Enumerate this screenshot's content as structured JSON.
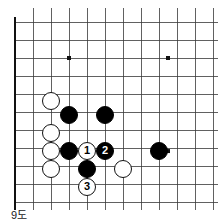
{
  "caption": "9도",
  "board": {
    "type": "go-board-diagram",
    "origin_x": 15,
    "origin_y": 22,
    "cell": 18,
    "cols": 12,
    "rows": 11,
    "line_color": "#3a3a3a",
    "edge_color": "#111111",
    "line_width": 0.8,
    "edge_width": 2.6,
    "background": "#ffffff",
    "thick_edges": [
      "left",
      "bottom"
    ],
    "star_points": [
      {
        "col": 3,
        "row": 2
      },
      {
        "col": 8.5,
        "row": 2
      },
      {
        "col": 8.5,
        "row": 7.17
      }
    ],
    "stone_radius": 9,
    "stones": [
      {
        "color": "white",
        "col": 2,
        "row": 4.39,
        "label": ""
      },
      {
        "color": "black",
        "col": 3,
        "row": 5.17,
        "label": ""
      },
      {
        "color": "black",
        "col": 5,
        "row": 5.17,
        "label": ""
      },
      {
        "color": "white",
        "col": 2,
        "row": 6.17,
        "label": ""
      },
      {
        "color": "white",
        "col": 2,
        "row": 7.17,
        "label": ""
      },
      {
        "color": "black",
        "col": 3,
        "row": 7.17,
        "label": ""
      },
      {
        "color": "white",
        "col": 4,
        "row": 7.17,
        "label": "1"
      },
      {
        "color": "black",
        "col": 5,
        "row": 7.17,
        "label": "2"
      },
      {
        "color": "black",
        "col": 8,
        "row": 7.17,
        "label": ""
      },
      {
        "color": "white",
        "col": 2,
        "row": 8.17,
        "label": ""
      },
      {
        "color": "black",
        "col": 4,
        "row": 8.17,
        "label": ""
      },
      {
        "color": "white",
        "col": 6,
        "row": 8.17,
        "label": ""
      },
      {
        "color": "white",
        "col": 4,
        "row": 9.17,
        "label": "3"
      }
    ]
  },
  "colors": {
    "black_stone": "#000000",
    "white_stone": "#ffffff",
    "stone_outline": "#111111",
    "grid": "#3a3a3a",
    "text": "#1a1a1a"
  }
}
